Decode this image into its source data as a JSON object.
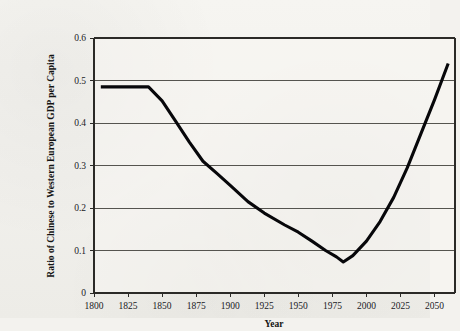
{
  "chart_data": {
    "type": "line",
    "title": "",
    "xlabel": "Year",
    "ylabel": "Ratio of Chinese to Western European GDP per Capita",
    "xlim": [
      1800,
      2065
    ],
    "ylim": [
      0,
      0.6
    ],
    "grid": true,
    "legend": "none",
    "x_ticks": [
      1800,
      1825,
      1850,
      1875,
      1900,
      1925,
      1950,
      1975,
      2000,
      2025,
      2050
    ],
    "x_tick_labels": [
      "1800",
      "1825",
      "1850",
      "1875",
      "1900",
      "1925",
      "1950",
      "1975",
      "2000",
      "2025",
      "2050"
    ],
    "y_ticks": [
      0,
      0.1,
      0.2,
      0.3,
      0.4,
      0.5,
      0.6
    ],
    "y_tick_labels": [
      "0",
      "0.1",
      "0.2",
      "0.3",
      "0.4",
      "0.5",
      "0.6"
    ],
    "series": [
      {
        "name": "Ratio of Chinese to Western European GDP per Capita",
        "color": "#07070a",
        "x": [
          1805,
          1820,
          1840,
          1850,
          1860,
          1870,
          1880,
          1890,
          1900,
          1913,
          1925,
          1940,
          1950,
          1960,
          1970,
          1978,
          1983,
          1990,
          2000,
          2010,
          2020,
          2030,
          2040,
          2050,
          2060
        ],
        "y": [
          0.485,
          0.485,
          0.485,
          0.452,
          0.404,
          0.355,
          0.31,
          0.282,
          0.253,
          0.215,
          0.188,
          0.16,
          0.143,
          0.122,
          0.1,
          0.085,
          0.073,
          0.088,
          0.122,
          0.168,
          0.225,
          0.295,
          0.375,
          0.455,
          0.54
        ]
      }
    ]
  },
  "axis_colors": {
    "gridline": "#55544f",
    "frame": "#2b2a27",
    "line": "#07070a",
    "background": "#f3f2ee"
  }
}
